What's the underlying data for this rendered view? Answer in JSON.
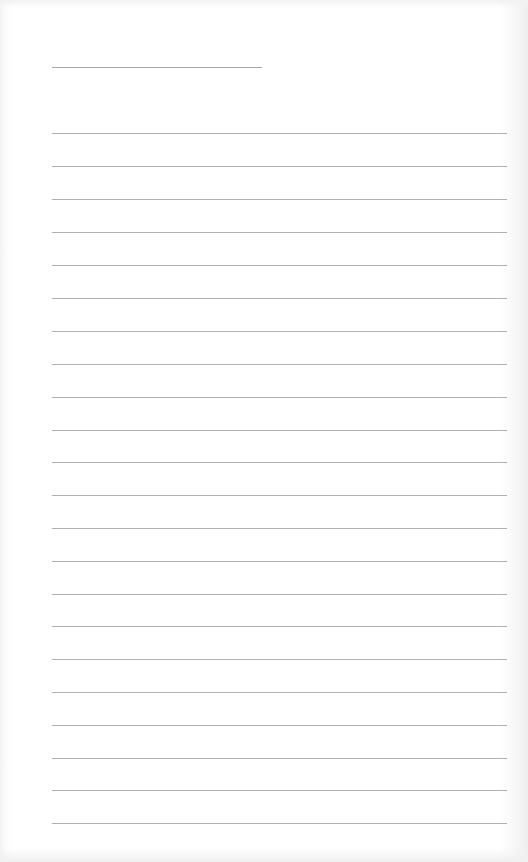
{
  "document": {
    "type": "blank lined page",
    "header_line": {
      "x": 52,
      "y": 67,
      "width": 210
    },
    "ruled_lines": {
      "count": 22,
      "x": 52,
      "width": 455,
      "positions_y": [
        133,
        166,
        199,
        232,
        265,
        298,
        331,
        364,
        397,
        430,
        462,
        495,
        528,
        561,
        594,
        626,
        659,
        692,
        725,
        758,
        790,
        823
      ]
    },
    "colors": {
      "paper": "#ffffff",
      "line": "#b0b0b0",
      "header_line": "#a9a9a9"
    }
  }
}
